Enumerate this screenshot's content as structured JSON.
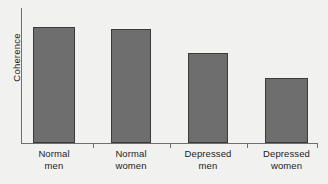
{
  "chart_data": {
    "type": "bar",
    "title": "",
    "xlabel": "",
    "ylabel": "Coherence",
    "categories": [
      "Normal men",
      "Normal women",
      "Depressed men",
      "Depressed women"
    ],
    "category_lines": [
      [
        "Normal",
        "men"
      ],
      [
        "Normal",
        "women"
      ],
      [
        "Depressed",
        "men"
      ],
      [
        "Depressed",
        "women"
      ]
    ],
    "values": [
      100,
      98,
      78,
      56
    ],
    "ylim": [
      0,
      105
    ],
    "y_tick_labels": [],
    "x_tick_labels": [],
    "grid": false,
    "legend": false,
    "legend_position": "none",
    "annotations": [],
    "series": [
      {
        "name": "Coherence",
        "values": [
          100,
          98,
          78,
          56
        ]
      }
    ]
  },
  "style": {
    "background_color": "#f1f1f0",
    "bar_fill_color": "#6e6e6e",
    "bar_border_color": "#3b3b3b",
    "axis_color": "#6f6f6f",
    "text_color": "#1d1d1d"
  },
  "axis": {
    "y_label": "Coherence"
  },
  "bars": [
    {
      "label_line1": "Normal",
      "label_line2": "men",
      "value": 100,
      "left": 33,
      "width": 42
    },
    {
      "label_line1": "Normal",
      "label_line2": "women",
      "value": 98,
      "left": 111,
      "width": 40
    },
    {
      "label_line1": "Depressed",
      "label_line2": "men",
      "value": 78,
      "left": 188,
      "width": 40
    },
    {
      "label_line1": "Depressed",
      "label_line2": "women",
      "value": 56,
      "left": 265,
      "width": 43
    }
  ],
  "ticks": [
    {
      "x": 93
    },
    {
      "x": 170
    },
    {
      "x": 247
    },
    {
      "x": 317
    }
  ]
}
